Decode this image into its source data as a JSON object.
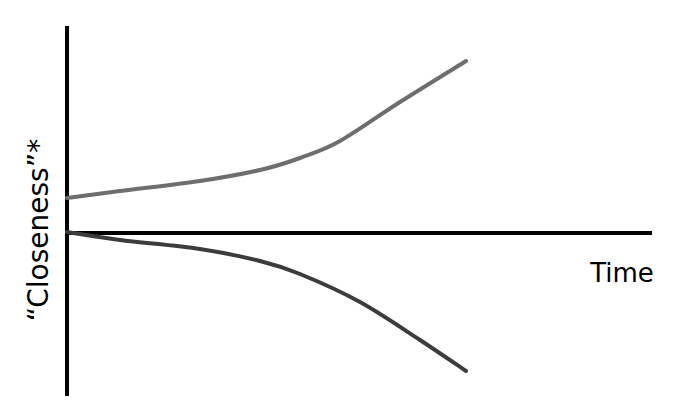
{
  "chart_data": {
    "type": "line",
    "title": "",
    "xlabel": "Time",
    "ylabel": "“Closeness”*",
    "grid": false,
    "legend": null,
    "axes": {
      "x_axis": {
        "x1": 67,
        "y1": 233,
        "x2": 652,
        "y2": 233
      },
      "y_axis": {
        "x1": 67,
        "y1": 26,
        "x2": 67,
        "y2": 396
      }
    },
    "series": [
      {
        "name": "upper-curve",
        "color": "#6e6e6e",
        "description": "starts above baseline and curves upward (diverging up)",
        "points": [
          [
            67,
            198
          ],
          [
            120,
            191
          ],
          [
            200,
            181
          ],
          [
            260,
            170
          ],
          [
            300,
            158
          ],
          [
            340,
            141
          ],
          [
            400,
            102
          ],
          [
            466,
            61
          ]
        ]
      },
      {
        "name": "lower-curve",
        "color": "#3c3c3c",
        "description": "starts at baseline and curves downward (diverging down)",
        "points": [
          [
            67,
            232
          ],
          [
            120,
            240
          ],
          [
            200,
            249
          ],
          [
            260,
            261
          ],
          [
            300,
            274
          ],
          [
            360,
            302
          ],
          [
            420,
            340
          ],
          [
            466,
            371
          ]
        ]
      }
    ]
  },
  "labels": {
    "x": {
      "text": "Time",
      "x": 622,
      "y": 282,
      "size": 26
    },
    "y": {
      "text": "“Closeness”*",
      "x": 48,
      "y": 230,
      "size": 28
    }
  }
}
